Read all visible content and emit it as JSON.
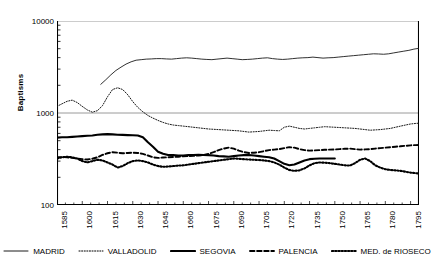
{
  "chart_data": {
    "type": "line",
    "title": "",
    "xlabel": "",
    "ylabel": "Baptisms",
    "yscale": "log",
    "ylim": [
      100,
      10000
    ],
    "ytick_labels": [
      "10000",
      "1000",
      "100"
    ],
    "ytick_values": [
      10000,
      1000,
      100
    ],
    "xlim": [
      1585,
      1800
    ],
    "xtick_labels": [
      "1585",
      "1600",
      "1615",
      "1630",
      "1645",
      "1660",
      "1675",
      "1690",
      "1705",
      "1720",
      "1735",
      "1750",
      "1765",
      "1780",
      "1795"
    ],
    "xtick_values": [
      1585,
      1600,
      1615,
      1630,
      1645,
      1660,
      1675,
      1690,
      1705,
      1720,
      1735,
      1750,
      1765,
      1780,
      1795
    ],
    "grid": "horizontal-major",
    "legend_position": "bottom",
    "series": [
      {
        "name": "MADRID",
        "style": "solid-thin",
        "color": "#1a1a1a",
        "x": [
          1611,
          1614,
          1617,
          1620,
          1623,
          1626,
          1629,
          1632,
          1635,
          1638,
          1641,
          1644,
          1647,
          1650,
          1653,
          1656,
          1659,
          1662,
          1665,
          1668,
          1671,
          1674,
          1677,
          1680,
          1683,
          1686,
          1689,
          1692,
          1695,
          1698,
          1701,
          1704,
          1707,
          1710,
          1713,
          1716,
          1719,
          1722,
          1725,
          1728,
          1731,
          1734,
          1737,
          1740,
          1743,
          1746,
          1749,
          1752,
          1755,
          1758,
          1761,
          1764,
          1767,
          1770,
          1773,
          1776,
          1779,
          1782,
          1785,
          1788,
          1791,
          1794,
          1797,
          1800
        ],
        "values": [
          2050,
          2300,
          2600,
          2900,
          3150,
          3400,
          3600,
          3750,
          3800,
          3850,
          3870,
          3900,
          3900,
          3870,
          3850,
          3900,
          3950,
          3980,
          3950,
          3900,
          3850,
          3820,
          3800,
          3850,
          3900,
          3950,
          3900,
          3850,
          3800,
          3820,
          3850,
          3900,
          3950,
          3980,
          3900,
          3850,
          3820,
          3850,
          3900,
          3950,
          3980,
          4000,
          4050,
          4000,
          3950,
          3980,
          4000,
          4050,
          4100,
          4150,
          4200,
          4250,
          4300,
          4350,
          4400,
          4380,
          4350,
          4400,
          4500,
          4600,
          4700,
          4800,
          4950,
          5050
        ]
      },
      {
        "name": "VALLADOLID",
        "style": "dotted-fine",
        "color": "#1a1a1a",
        "x": [
          1585,
          1588,
          1591,
          1594,
          1597,
          1600,
          1603,
          1606,
          1609,
          1612,
          1615,
          1618,
          1621,
          1624,
          1627,
          1630,
          1633,
          1636,
          1639,
          1642,
          1645,
          1648,
          1651,
          1654,
          1657,
          1660,
          1663,
          1666,
          1669,
          1672,
          1675,
          1678,
          1681,
          1684,
          1687,
          1690,
          1693,
          1696,
          1699,
          1702,
          1705,
          1708,
          1711,
          1714,
          1717,
          1720,
          1723,
          1726,
          1729,
          1732,
          1735,
          1738,
          1741,
          1744,
          1747,
          1750,
          1753,
          1756,
          1759,
          1762,
          1765,
          1768,
          1771,
          1774,
          1777,
          1780,
          1783,
          1786,
          1789,
          1792,
          1795,
          1798,
          1800
        ],
        "values": [
          1180,
          1260,
          1340,
          1380,
          1300,
          1180,
          1080,
          1020,
          1060,
          1200,
          1500,
          1800,
          1880,
          1800,
          1580,
          1330,
          1150,
          1030,
          940,
          880,
          830,
          790,
          760,
          740,
          730,
          720,
          710,
          700,
          690,
          680,
          670,
          665,
          660,
          655,
          650,
          645,
          640,
          630,
          620,
          625,
          630,
          640,
          650,
          645,
          640,
          700,
          720,
          700,
          680,
          670,
          680,
          690,
          700,
          710,
          705,
          700,
          695,
          690,
          685,
          680,
          670,
          660,
          650,
          655,
          660,
          670,
          680,
          700,
          720,
          740,
          760,
          770,
          775
        ]
      },
      {
        "name": "SEGOVIA",
        "style": "solid-thick",
        "color": "#000000",
        "x": [
          1585,
          1588,
          1591,
          1594,
          1597,
          1600,
          1603,
          1606,
          1609,
          1612,
          1615,
          1618,
          1621,
          1624,
          1627,
          1630,
          1633,
          1636,
          1639,
          1642,
          1645,
          1648,
          1651,
          1654,
          1657,
          1660,
          1663,
          1666,
          1669,
          1672,
          1675,
          1678,
          1681,
          1684,
          1687,
          1690,
          1693,
          1696,
          1699,
          1702,
          1705,
          1708,
          1711,
          1714,
          1717,
          1720,
          1723,
          1726,
          1729,
          1732,
          1735,
          1738,
          1741,
          1744,
          1747,
          1750
        ],
        "values": [
          540,
          545,
          545,
          550,
          555,
          560,
          565,
          570,
          580,
          585,
          590,
          585,
          580,
          578,
          575,
          572,
          570,
          545,
          480,
          430,
          380,
          360,
          350,
          348,
          345,
          345,
          348,
          350,
          352,
          350,
          348,
          345,
          340,
          338,
          335,
          340,
          345,
          348,
          350,
          345,
          340,
          335,
          330,
          320,
          300,
          280,
          270,
          275,
          290,
          305,
          315,
          318,
          320,
          320,
          320,
          320
        ]
      },
      {
        "name": "PALENCIA",
        "style": "dashed",
        "color": "#000000",
        "x": [
          1585,
          1588,
          1591,
          1594,
          1597,
          1600,
          1603,
          1606,
          1609,
          1612,
          1615,
          1618,
          1621,
          1624,
          1627,
          1630,
          1633,
          1636,
          1639,
          1642,
          1645,
          1648,
          1651,
          1654,
          1657,
          1660,
          1663,
          1666,
          1669,
          1672,
          1675,
          1678,
          1681,
          1684,
          1687,
          1690,
          1693,
          1696,
          1699,
          1702,
          1705,
          1708,
          1711,
          1714,
          1717,
          1720,
          1723,
          1726,
          1729,
          1732,
          1735,
          1738,
          1741,
          1744,
          1747,
          1750,
          1753,
          1756,
          1759,
          1762,
          1765,
          1768,
          1771,
          1774,
          1777,
          1780,
          1783,
          1786,
          1789,
          1792,
          1795,
          1798,
          1800
        ],
        "values": [
          330,
          332,
          330,
          325,
          320,
          315,
          312,
          318,
          330,
          350,
          365,
          375,
          370,
          365,
          368,
          370,
          368,
          360,
          345,
          330,
          325,
          328,
          330,
          332,
          335,
          338,
          340,
          342,
          345,
          350,
          360,
          375,
          395,
          410,
          420,
          410,
          390,
          375,
          368,
          370,
          375,
          385,
          395,
          400,
          405,
          415,
          425,
          420,
          405,
          395,
          390,
          392,
          395,
          398,
          400,
          402,
          405,
          408,
          410,
          405,
          400,
          402,
          405,
          410,
          415,
          420,
          425,
          430,
          435,
          440,
          445,
          448,
          450
        ]
      },
      {
        "name": "MED. de RIOSECO",
        "style": "dotted-thick",
        "color": "#000000",
        "x": [
          1585,
          1588,
          1591,
          1594,
          1597,
          1600,
          1603,
          1606,
          1609,
          1612,
          1615,
          1618,
          1621,
          1624,
          1627,
          1630,
          1633,
          1636,
          1639,
          1642,
          1645,
          1648,
          1651,
          1654,
          1657,
          1660,
          1663,
          1666,
          1669,
          1672,
          1675,
          1678,
          1681,
          1684,
          1687,
          1690,
          1693,
          1696,
          1699,
          1702,
          1705,
          1708,
          1711,
          1714,
          1717,
          1720,
          1723,
          1726,
          1729,
          1732,
          1735,
          1738,
          1741,
          1744,
          1747,
          1750,
          1753,
          1756,
          1759,
          1762,
          1765,
          1768,
          1771,
          1774,
          1777,
          1780,
          1783,
          1786,
          1789,
          1792,
          1795,
          1798,
          1800
        ],
        "values": [
          320,
          330,
          335,
          330,
          320,
          300,
          290,
          300,
          310,
          305,
          290,
          275,
          255,
          265,
          285,
          300,
          305,
          300,
          290,
          275,
          265,
          260,
          262,
          265,
          268,
          270,
          275,
          280,
          285,
          290,
          295,
          300,
          305,
          310,
          315,
          320,
          318,
          315,
          312,
          310,
          308,
          305,
          300,
          290,
          275,
          255,
          240,
          235,
          238,
          250,
          270,
          285,
          290,
          288,
          285,
          280,
          275,
          270,
          268,
          285,
          310,
          320,
          300,
          270,
          255,
          245,
          240,
          238,
          235,
          230,
          225,
          222,
          220
        ]
      }
    ]
  },
  "legend": {
    "items": [
      {
        "label": "MADRID",
        "style": "solid-thin"
      },
      {
        "label": "VALLADOLID",
        "style": "dotted-fine"
      },
      {
        "label": "SEGOVIA",
        "style": "solid-thick"
      },
      {
        "label": "PALENCIA",
        "style": "dashed"
      },
      {
        "label": "MED. de RIOSECO",
        "style": "dotted-thick"
      }
    ]
  }
}
